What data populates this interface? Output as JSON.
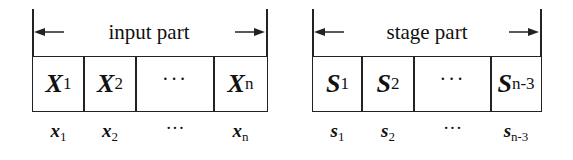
{
  "groups": [
    {
      "label": "input part",
      "cells": [
        {
          "var": "X",
          "sub": "1"
        },
        {
          "var": "X",
          "sub": "2"
        },
        {
          "var": "···",
          "sub": ""
        },
        {
          "var": "X",
          "sub": "n"
        }
      ],
      "values": [
        {
          "var": "x",
          "sub": "1"
        },
        {
          "var": "x",
          "sub": "2"
        },
        {
          "var": "···",
          "sub": ""
        },
        {
          "var": "x",
          "sub": "n"
        }
      ]
    },
    {
      "label": "stage part",
      "cells": [
        {
          "var": "S",
          "sub": "1"
        },
        {
          "var": "S",
          "sub": "2"
        },
        {
          "var": "···",
          "sub": ""
        },
        {
          "var": "S",
          "sub": "n-3"
        }
      ],
      "values": [
        {
          "var": "s",
          "sub": "1"
        },
        {
          "var": "s",
          "sub": "2"
        },
        {
          "var": "···",
          "sub": ""
        },
        {
          "var": "s",
          "sub": "n-3"
        }
      ]
    }
  ]
}
